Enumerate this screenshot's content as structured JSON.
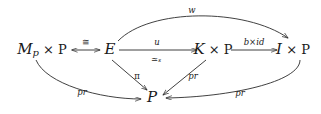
{
  "diagram": {
    "type": "commutative-diagram",
    "title": "",
    "nodes": [
      {
        "id": "mp",
        "label": "M",
        "sub": "p",
        "suffix": " × P",
        "x": 42,
        "y": 50
      },
      {
        "id": "e",
        "label": "E",
        "sub": "",
        "suffix": "",
        "x": 110,
        "y": 50
      },
      {
        "id": "kp",
        "label": "K",
        "sub": "",
        "suffix": " × P",
        "x": 213,
        "y": 50
      },
      {
        "id": "ip",
        "label": "I",
        "sub": "",
        "suffix": " × P",
        "x": 293,
        "y": 50
      },
      {
        "id": "p",
        "label": "P",
        "sub": "",
        "suffix": "",
        "x": 152,
        "y": 98
      }
    ],
    "edges": [
      {
        "id": "mp-e",
        "from": "mp",
        "to": "e",
        "label": "≅",
        "label_sub": "",
        "style": "double-headed",
        "label_pos": "above"
      },
      {
        "id": "e-kp",
        "from": "e",
        "to": "kp",
        "label": "u",
        "label_sub": "",
        "style": "arrow",
        "label_pos": "above"
      },
      {
        "id": "e-kp-below",
        "from": "e",
        "to": "kp",
        "label": "≃",
        "label_sub": "s",
        "style": "none",
        "label_pos": "below"
      },
      {
        "id": "kp-ip",
        "from": "kp",
        "to": "ip",
        "label": "b×id",
        "label_sub": "",
        "style": "arrow",
        "label_pos": "above"
      },
      {
        "id": "e-ip",
        "from": "e",
        "to": "ip",
        "label": "w",
        "label_sub": "",
        "style": "arc-over",
        "label_pos": "above"
      },
      {
        "id": "mp-p",
        "from": "mp",
        "to": "p",
        "label": "pr",
        "label_sub": "",
        "style": "arc-under",
        "label_pos": "above"
      },
      {
        "id": "e-p",
        "from": "e",
        "to": "p",
        "label": "π",
        "label_sub": "",
        "style": "arrow",
        "label_pos": "right"
      },
      {
        "id": "kp-p",
        "from": "kp",
        "to": "p",
        "label": "pr",
        "label_sub": "",
        "style": "arrow",
        "label_pos": "left"
      },
      {
        "id": "ip-p",
        "from": "ip",
        "to": "p",
        "label": "pr",
        "label_sub": "",
        "style": "arc-under",
        "label_pos": "above"
      }
    ],
    "labels": {
      "iso": "≅",
      "u": "u",
      "simeq": "≃",
      "simeq_sub": "s",
      "bxid": "b×id",
      "w": "w",
      "pi": "π",
      "pr": "pr",
      "times": "×"
    },
    "colors": {
      "ink": "#2b2b2b",
      "text": "#1a1a1a",
      "background": "#ffffff"
    }
  }
}
